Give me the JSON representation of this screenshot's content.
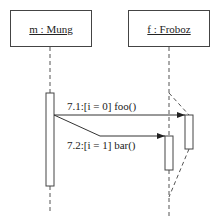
{
  "diagram": {
    "type": "uml-sequence",
    "objects": [
      {
        "id": "m",
        "label": "m : Mung"
      },
      {
        "id": "f",
        "label": "f : Froboz"
      }
    ],
    "messages": [
      {
        "number": "7.1",
        "label": "7.1:[i = 0] foo()",
        "from": "m",
        "to": "f",
        "guard": "[i = 0]",
        "operation": "foo()"
      },
      {
        "number": "7.2",
        "label": "7.2:[i = 1] bar()",
        "from": "m",
        "to": "f",
        "guard": "[i = 1]",
        "operation": "bar()"
      }
    ],
    "colors": {
      "line": "#444444",
      "text": "#222222",
      "background": "#ffffff"
    }
  }
}
